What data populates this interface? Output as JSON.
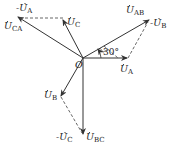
{
  "diagram": {
    "type": "phasor-diagram",
    "origin_label": "O",
    "angle_label": "30°",
    "phasors": [
      {
        "id": "UA",
        "label": "U",
        "sub": "A",
        "prefix": "",
        "kind": "solid"
      },
      {
        "id": "UB",
        "label": "U",
        "sub": "B",
        "prefix": "",
        "kind": "solid"
      },
      {
        "id": "UC",
        "label": "U",
        "sub": "C",
        "prefix": "",
        "kind": "solid"
      },
      {
        "id": "UAB",
        "label": "U",
        "sub": "AB",
        "prefix": "",
        "kind": "solid"
      },
      {
        "id": "UBC",
        "label": "U",
        "sub": "BC",
        "prefix": "",
        "kind": "solid"
      },
      {
        "id": "UCA",
        "label": "U",
        "sub": "CA",
        "prefix": "",
        "kind": "solid"
      },
      {
        "id": "negUA",
        "label": "U",
        "sub": "A",
        "prefix": "-",
        "kind": "dashed"
      },
      {
        "id": "negUB",
        "label": "U",
        "sub": "B",
        "prefix": "-",
        "kind": "dashed"
      },
      {
        "id": "negUC",
        "label": "U",
        "sub": "C",
        "prefix": "-",
        "kind": "dashed"
      }
    ],
    "colors": {
      "line": "#333333",
      "dash": "#555555",
      "text": "#222222"
    }
  }
}
